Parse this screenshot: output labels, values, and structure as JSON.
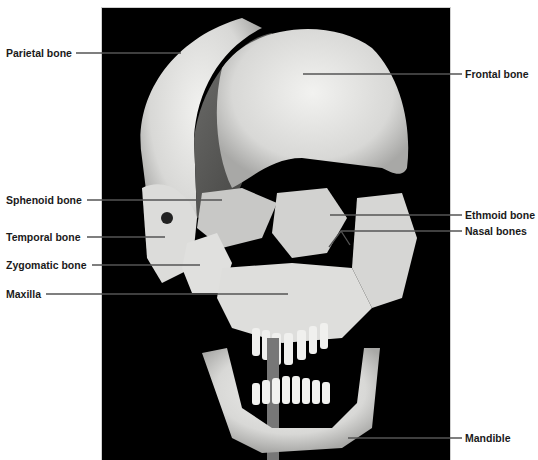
{
  "figure": {
    "labels_left": [
      {
        "id": "parietal",
        "text": "Parietal bone"
      },
      {
        "id": "sphenoid",
        "text": "Sphenoid bone"
      },
      {
        "id": "temporal",
        "text": "Temporal bone"
      },
      {
        "id": "zygomatic",
        "text": "Zygomatic bone"
      },
      {
        "id": "maxilla",
        "text": "Maxilla"
      }
    ],
    "labels_right": [
      {
        "id": "frontal",
        "text": "Frontal bone"
      },
      {
        "id": "ethmoid",
        "text": "Ethmoid bone"
      },
      {
        "id": "nasal",
        "text": "Nasal bones"
      },
      {
        "id": "mandible",
        "text": "Mandible"
      }
    ],
    "colors": {
      "background": "#ffffff",
      "photo_background": "#000000",
      "bone": "#e8e8e6",
      "bone_shadow": "#8a8a88",
      "leader_line": "#555555",
      "label_text": "#1a1a1a"
    }
  }
}
